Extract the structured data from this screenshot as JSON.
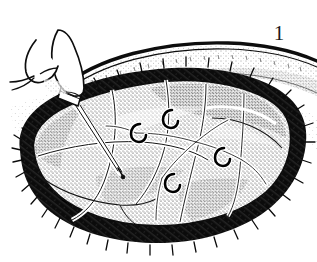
{
  "figure": {
    "number": "1",
    "caption_text": "1",
    "background_color": "#ffffff",
    "ink_color": "#111111",
    "style": "pen-and-ink stipple line drawing"
  },
  "elements": {
    "hand": {
      "name": "surgeon-hand",
      "description": "hand with thumb and index finger gripping instrument, upper left"
    },
    "instrument": {
      "name": "needle-probe",
      "description": "slender straight shafted instrument angled down-right into the organ surface",
      "tip_point": "organ surface mid-left"
    },
    "organ": {
      "name": "exposed-organ",
      "description": "large stippled multi-lobed organ occupying center of the field",
      "lobes": 5,
      "fissures": 4
    },
    "vessels": {
      "name": "vessel-tree",
      "description": "pale branching vessels radiating across the organ surface"
    },
    "ligature_clips": [
      {
        "id": "clip-1",
        "x": 144,
        "y": 130,
        "note": "hook-shaped ligature clip on vessel branch"
      },
      {
        "id": "clip-2",
        "x": 176,
        "y": 118,
        "note": "hook-shaped ligature clip on vessel branch"
      },
      {
        "id": "clip-3",
        "x": 226,
        "y": 155,
        "note": "hook-shaped ligature clip on vessel branch"
      },
      {
        "id": "clip-4",
        "x": 176,
        "y": 182,
        "note": "hook-shaped ligature clip on vessel branch"
      }
    ],
    "surrounding_tissue": {
      "name": "dark-hatched-tissue",
      "description": "dense black cross-hatched tissue bed framing the organ on all sides"
    },
    "skin_edge": {
      "name": "retracted-skin-edge",
      "description": "curved stippled band of skin / abdominal wall arcing across the upper portion"
    }
  }
}
